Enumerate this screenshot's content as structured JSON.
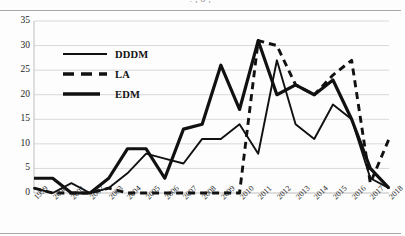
{
  "figure": {
    "title_remnant": ". , o ,",
    "background": "#ffffff",
    "line_color": "#111111",
    "grid_color": "#d9d9d9"
  },
  "legend": {
    "position": "inside-top-left",
    "entries": [
      {
        "label": "DDDM",
        "style": "solid-thin",
        "icon": "legend-line-solid-icon"
      },
      {
        "label": "LA",
        "style": "dashed",
        "icon": "legend-line-dashed-icon"
      },
      {
        "label": "EDM",
        "style": "solid-thick",
        "icon": "legend-line-thick-icon"
      }
    ]
  },
  "chart_data": {
    "type": "line",
    "title": "",
    "subtitle": "",
    "xlabel": "",
    "ylabel": "",
    "xlim": [
      1999,
      2018
    ],
    "ylim": [
      0,
      35
    ],
    "ytick_step": 5,
    "yticks": [
      0,
      5,
      10,
      15,
      20,
      25,
      30,
      35
    ],
    "ytick_labels": [
      "0",
      "5",
      "10",
      "15",
      "20",
      "25",
      "30",
      "35"
    ],
    "grid": "horizontal",
    "legend_position": "inside-top-left",
    "x": [
      1999,
      2000,
      2001,
      2002,
      2003,
      2004,
      2005,
      2006,
      2007,
      2008,
      2009,
      2010,
      2011,
      2012,
      2013,
      2014,
      2015,
      2016,
      2017,
      2018
    ],
    "categories": [
      "1999",
      "2000",
      "2001",
      "2002",
      "2003",
      "2004",
      "2005",
      "2006",
      "2007",
      "2008",
      "2009",
      "2010",
      "2011",
      "2012",
      "2013",
      "2014",
      "2015",
      "2016",
      "2017",
      "2018"
    ],
    "series": [
      {
        "name": "DDDM",
        "style": "solid",
        "values": [
          1,
          0,
          2,
          0,
          1,
          4,
          8,
          7,
          6,
          11,
          11,
          14,
          8,
          27,
          14,
          11,
          18,
          15,
          3,
          1
        ]
      },
      {
        "name": "LA",
        "style": "dashed",
        "values": [
          1,
          0,
          0,
          0,
          1,
          0,
          0,
          0,
          0,
          0,
          0,
          0,
          31,
          30,
          22,
          20,
          24,
          27,
          2,
          11
        ]
      },
      {
        "name": "EDM",
        "style": "solid-thick",
        "values": [
          3,
          3,
          0,
          0,
          3,
          9,
          9,
          3,
          13,
          14,
          26,
          17,
          31,
          20,
          22,
          20,
          23,
          15,
          5,
          1
        ]
      }
    ],
    "annotations": []
  }
}
